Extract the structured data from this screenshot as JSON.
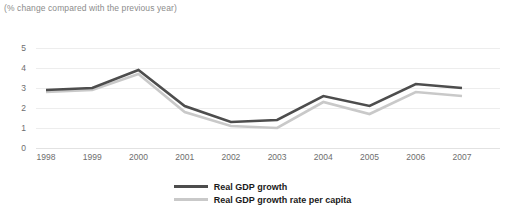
{
  "subtitle": "(% change compared with the previous year)",
  "legend": {
    "position": "bottom-center",
    "items": [
      {
        "label": "Real GDP growth",
        "color": "#4d4d4d",
        "icon": "line-swatch-icon"
      },
      {
        "label": "Real GDP growth rate per capita",
        "color": "#c9c9c9",
        "icon": "line-swatch-icon"
      }
    ]
  },
  "axis": {
    "y_ticks": [
      "5",
      "4",
      "3",
      "2",
      "1",
      "0"
    ],
    "x_ticks": [
      "1998",
      "1999",
      "2000",
      "2001",
      "2002",
      "2003",
      "2004",
      "2005",
      "2006",
      "2007"
    ]
  },
  "chart_data": {
    "type": "line",
    "title": "",
    "subtitle": "(% change compared with the previous year)",
    "xlabel": "",
    "ylabel": "",
    "ylim": [
      0,
      5
    ],
    "yticks": [
      0,
      1,
      2,
      3,
      4,
      5
    ],
    "grid": true,
    "legend_position": "bottom-center",
    "categories": [
      "1998",
      "1999",
      "2000",
      "2001",
      "2002",
      "2003",
      "2004",
      "2005",
      "2006",
      "2007"
    ],
    "series": [
      {
        "name": "Real GDP growth",
        "color": "#4d4d4d",
        "values": [
          2.9,
          3.0,
          3.9,
          2.1,
          1.3,
          1.4,
          2.6,
          2.1,
          3.2,
          3.0
        ]
      },
      {
        "name": "Real GDP growth rate per capita",
        "color": "#c9c9c9",
        "values": [
          2.8,
          2.9,
          3.7,
          1.8,
          1.1,
          1.0,
          2.3,
          1.7,
          2.8,
          2.6
        ]
      }
    ]
  }
}
